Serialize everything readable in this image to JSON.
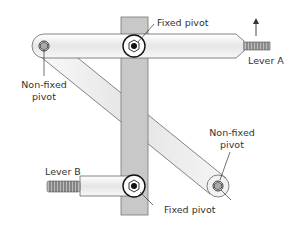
{
  "diagram": {
    "type": "linkage-mechanism",
    "labels": {
      "fixed_pivot_top": "Fixed pivot",
      "fixed_pivot_bottom": "Fixed pivot",
      "nonfixed_pivot_left_line1": "Non-fixed",
      "nonfixed_pivot_left_line2": "pivot",
      "nonfixed_pivot_right_line1": "Non-fixed",
      "nonfixed_pivot_right_line2": "pivot",
      "lever_a": "Lever A",
      "lever_b": "Lever B"
    },
    "colors": {
      "frame_bar": "#c8c8c8",
      "link_fill": "#efefef",
      "outline": "#555555",
      "text": "#333333"
    },
    "annotations": {
      "lever_a_direction": "up-arrow"
    }
  }
}
